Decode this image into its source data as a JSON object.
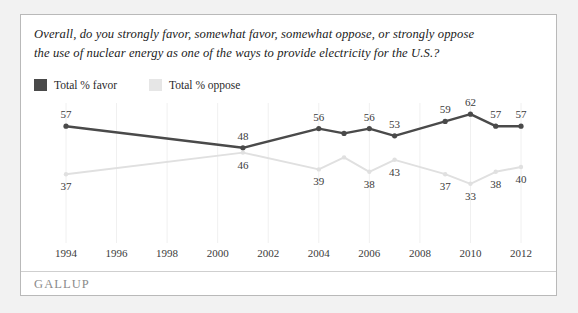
{
  "card": {
    "title_line1": "Overall, do you strongly favor, somewhat favor, somewhat oppose, or strongly oppose",
    "title_line2": "the use of nuclear energy as one of the ways to provide electricity for the U.S.?",
    "brand": "GALLUP"
  },
  "legend": {
    "items": [
      {
        "label": "Total % favor",
        "color": "#4a4a4a",
        "swatch": "favor-swatch"
      },
      {
        "label": "Total % oppose",
        "color": "#e6e6e6",
        "swatch": "oppose-swatch"
      }
    ]
  },
  "chart_data": {
    "type": "line",
    "title": "Overall, do you strongly favor, somewhat favor, somewhat oppose, or strongly oppose the use of nuclear energy as one of the ways to provide electricity for the U.S.?",
    "xlabel": "",
    "ylabel": "",
    "ylim": [
      25,
      70
    ],
    "xlim": [
      1994,
      2012
    ],
    "grid": "faint vertical gridlines at even years",
    "legend_position": "top-left",
    "xticks": [
      1994,
      1996,
      1998,
      2000,
      2002,
      2004,
      2006,
      2008,
      2010,
      2012
    ],
    "series": [
      {
        "name": "Total % favor",
        "color": "#4a4a4a",
        "points": [
          {
            "x": 1994,
            "y": 57,
            "label": "57",
            "label_pos": "above"
          },
          {
            "x": 2001,
            "y": 48,
            "label": "48",
            "label_pos": "above"
          },
          {
            "x": 2004,
            "y": 56,
            "label": "56",
            "label_pos": "above"
          },
          {
            "x": 2005,
            "y": 54,
            "label": "",
            "label_pos": "none"
          },
          {
            "x": 2006,
            "y": 56,
            "label": "56",
            "label_pos": "above"
          },
          {
            "x": 2007,
            "y": 53,
            "label": "53",
            "label_pos": "above"
          },
          {
            "x": 2009,
            "y": 59,
            "label": "59",
            "label_pos": "above"
          },
          {
            "x": 2010,
            "y": 62,
            "label": "62",
            "label_pos": "above"
          },
          {
            "x": 2011,
            "y": 57,
            "label": "57",
            "label_pos": "above"
          },
          {
            "x": 2012,
            "y": 57,
            "label": "57",
            "label_pos": "above"
          }
        ]
      },
      {
        "name": "Total % oppose",
        "color": "#e0e0e0",
        "points": [
          {
            "x": 1994,
            "y": 37,
            "label": "37",
            "label_pos": "below"
          },
          {
            "x": 2001,
            "y": 46,
            "label": "46",
            "label_pos": "below"
          },
          {
            "x": 2004,
            "y": 39,
            "label": "39",
            "label_pos": "below"
          },
          {
            "x": 2005,
            "y": 44,
            "label": "",
            "label_pos": "none"
          },
          {
            "x": 2006,
            "y": 38,
            "label": "38",
            "label_pos": "below"
          },
          {
            "x": 2007,
            "y": 43,
            "label": "43",
            "label_pos": "below"
          },
          {
            "x": 2009,
            "y": 37,
            "label": "37",
            "label_pos": "below"
          },
          {
            "x": 2010,
            "y": 33,
            "label": "33",
            "label_pos": "below"
          },
          {
            "x": 2011,
            "y": 38,
            "label": "38",
            "label_pos": "below"
          },
          {
            "x": 2012,
            "y": 40,
            "label": "40",
            "label_pos": "below"
          }
        ]
      }
    ]
  }
}
